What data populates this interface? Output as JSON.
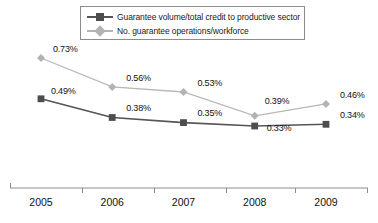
{
  "chart_data": {
    "type": "line",
    "title": "",
    "xlabel": "",
    "ylabel": "",
    "categories": [
      "2005",
      "2006",
      "2007",
      "2008",
      "2009"
    ],
    "grid": false,
    "legend_position": "top",
    "ylim": [
      0.0,
      0.8
    ],
    "axis_visible": {
      "x": true,
      "y": false
    },
    "series": [
      {
        "name": "Guarantee volume/total credit to productive sector",
        "marker": "square",
        "color": "#4d4d4d",
        "line_color": "#555555",
        "values": [
          0.49,
          0.38,
          0.35,
          0.33,
          0.34
        ],
        "labels": [
          "0.49%",
          "0.38%",
          "0.35%",
          "0.33%",
          "0.34%"
        ]
      },
      {
        "name": "No. guarantee operations/workforce",
        "marker": "diamond",
        "color": "#b3b3b3",
        "line_color": "#b8b8b8",
        "values": [
          0.73,
          0.56,
          0.53,
          0.39,
          0.46
        ],
        "labels": [
          "0.73%",
          "0.56%",
          "0.53%",
          "0.39%",
          "0.46%"
        ]
      }
    ]
  },
  "legend": {
    "items": [
      {
        "label": "Guarantee volume/total credit to productive sector"
      },
      {
        "label": "No. guarantee operations/workforce"
      }
    ]
  },
  "axis": {
    "x_ticks": [
      "2005",
      "2006",
      "2007",
      "2008",
      "2009"
    ]
  },
  "labels": {
    "s1": [
      "0.49%",
      "0.38%",
      "0.35%",
      "0.33%",
      "0.34%"
    ],
    "s2": [
      "0.73%",
      "0.56%",
      "0.53%",
      "0.39%",
      "0.46%"
    ]
  },
  "colors": {
    "series_dark": "#4d4d4d",
    "series_light": "#b3b3b3",
    "axis": "#8c8c8c",
    "text": "#111111"
  }
}
